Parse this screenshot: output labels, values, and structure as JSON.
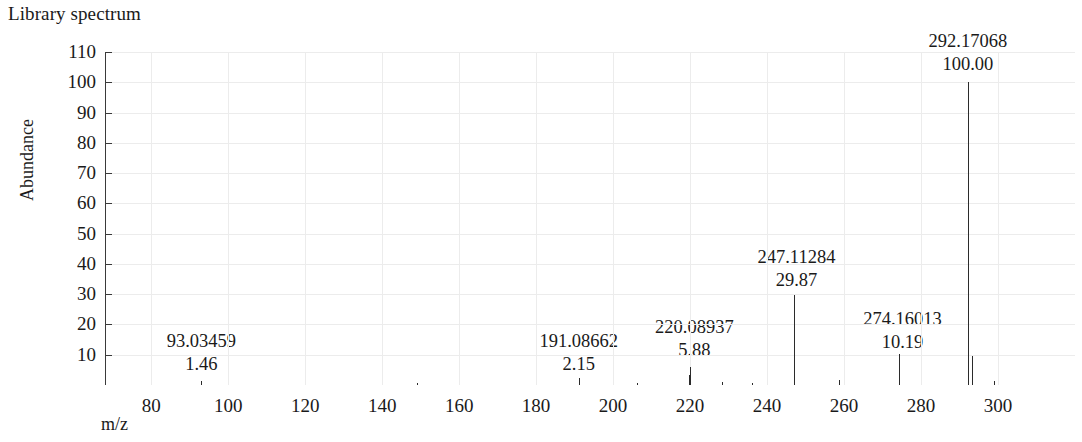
{
  "chart_title": "Library spectrum",
  "axes": {
    "x_label": "m/z",
    "y_label": "Abundance",
    "x_ticks": [
      "80",
      "100",
      "120",
      "140",
      "160",
      "180",
      "200",
      "220",
      "240",
      "260",
      "280",
      "300"
    ],
    "y_ticks": [
      "110",
      "100",
      "90",
      "80",
      "70",
      "60",
      "50",
      "40",
      "30",
      "20",
      "10"
    ]
  },
  "colors": {
    "axis": "#3a3a3a",
    "grid": "#ececec",
    "peak": "#2b2b2b",
    "text": "#1a1a1a"
  },
  "chart_data": {
    "type": "bar",
    "title": "Library spectrum",
    "subtitle": "",
    "xlabel": "m/z",
    "ylabel": "Abundance",
    "xlim": [
      68,
      320
    ],
    "ylim": [
      0,
      115
    ],
    "grid": true,
    "legend": "none",
    "x_tick_values": [
      80,
      100,
      120,
      140,
      160,
      180,
      200,
      220,
      240,
      260,
      280,
      300
    ],
    "y_tick_values": [
      10,
      20,
      30,
      40,
      50,
      60,
      70,
      80,
      90,
      100,
      110
    ],
    "labeled_peaks": [
      {
        "mz": 93.03459,
        "intensity": 1.46,
        "mz_text": "93.03459",
        "intensity_text": "1.46"
      },
      {
        "mz": 191.08662,
        "intensity": 2.15,
        "mz_text": "191.08662",
        "intensity_text": "2.15"
      },
      {
        "mz": 220.08937,
        "intensity": 5.88,
        "mz_text": "220.08937",
        "intensity_text": "5.88"
      },
      {
        "mz": 247.11284,
        "intensity": 29.87,
        "mz_text": "247.11284",
        "intensity_text": "29.87"
      },
      {
        "mz": 274.16013,
        "intensity": 10.19,
        "mz_text": "274.16013",
        "intensity_text": "10.19"
      },
      {
        "mz": 292.17068,
        "intensity": 100.0,
        "mz_text": "292.17068",
        "intensity_text": "100.00"
      }
    ],
    "unlabeled_peaks": [
      {
        "mz": 93.03459,
        "intensity": 1.46
      },
      {
        "mz": 149.02,
        "intensity": 0.7
      },
      {
        "mz": 191.08662,
        "intensity": 2.15
      },
      {
        "mz": 206.1,
        "intensity": 0.8
      },
      {
        "mz": 219.6,
        "intensity": 3.2
      },
      {
        "mz": 220.08937,
        "intensity": 5.88
      },
      {
        "mz": 228.4,
        "intensity": 1.1
      },
      {
        "mz": 236.0,
        "intensity": 0.6
      },
      {
        "mz": 247.11284,
        "intensity": 29.87
      },
      {
        "mz": 258.6,
        "intensity": 1.6
      },
      {
        "mz": 274.16013,
        "intensity": 10.19
      },
      {
        "mz": 292.17068,
        "intensity": 100.0
      },
      {
        "mz": 293.3,
        "intensity": 9.5
      },
      {
        "mz": 299.0,
        "intensity": 1.2
      }
    ]
  }
}
